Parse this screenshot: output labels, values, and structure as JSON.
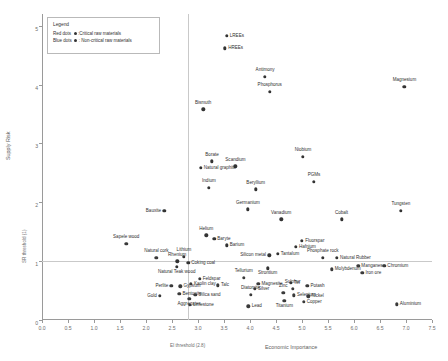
{
  "legend": {
    "title": "Legend",
    "entries": [
      {
        "prefix": "Red dots",
        "suffix": ":Critical raw materials",
        "color": "#333333"
      },
      {
        "prefix": "Blue dots",
        "suffix": ": Non-critical raw materials",
        "color": "#3a3a3a"
      }
    ]
  },
  "chart_data": {
    "type": "scatter",
    "title": "",
    "xlabel": "Economic Importance",
    "ylabel": "Supply Risk",
    "xlim": [
      0.0,
      7.5
    ],
    "ylim": [
      0,
      5.2
    ],
    "xticks": [
      "0.0",
      "0.5",
      "1.0",
      "1.5",
      "2.0",
      "2.5",
      "3.0",
      "3.5",
      "4.0",
      "4.5",
      "5.0",
      "5.5",
      "6.0",
      "6.5",
      "7.0",
      "7.5"
    ],
    "yticks": [
      "0",
      "1",
      "2",
      "3",
      "4",
      "5"
    ],
    "grid": false,
    "legend_position": "top-left",
    "annotations": [
      {
        "name": "ei-threshold",
        "label": "EI threshold (2.8)",
        "axis": "x",
        "value": 2.8
      },
      {
        "name": "sr-threshold",
        "label": "SR threshold (1)",
        "axis": "y",
        "value": 1.0
      }
    ],
    "series": [
      {
        "name": "Critical raw materials",
        "color": "#333333",
        "points": [
          {
            "label": "LREEs",
            "x": 3.55,
            "y": 4.83,
            "pos": "right"
          },
          {
            "label": "HREEs",
            "x": 3.52,
            "y": 4.62,
            "pos": "right"
          },
          {
            "label": "Antimony",
            "x": 4.29,
            "y": 4.13,
            "pos": "above"
          },
          {
            "label": "Phosphorus",
            "x": 4.38,
            "y": 3.88,
            "pos": "above"
          },
          {
            "label": "Bismuth",
            "x": 3.1,
            "y": 3.58,
            "pos": "above"
          },
          {
            "label": "Magnesium",
            "x": 6.97,
            "y": 3.96,
            "pos": "above"
          },
          {
            "label": "Niobium",
            "x": 5.02,
            "y": 2.77,
            "pos": "above"
          },
          {
            "label": "Borate",
            "x": 3.27,
            "y": 2.7,
            "pos": "above"
          },
          {
            "label": "Scandium",
            "x": 3.72,
            "y": 2.61,
            "pos": "above"
          },
          {
            "label": "Natural graphite",
            "x": 3.05,
            "y": 2.59,
            "pos": "right"
          },
          {
            "label": "PGMs",
            "x": 5.23,
            "y": 2.35,
            "pos": "above"
          },
          {
            "label": "Indium",
            "x": 3.21,
            "y": 2.25,
            "pos": "above"
          },
          {
            "label": "Beryllium",
            "x": 4.11,
            "y": 2.22,
            "pos": "above"
          },
          {
            "label": "Germanium",
            "x": 3.96,
            "y": 1.88,
            "pos": "above"
          },
          {
            "label": "Vanadium",
            "x": 4.6,
            "y": 1.71,
            "pos": "above"
          },
          {
            "label": "Tungsten",
            "x": 6.9,
            "y": 1.86,
            "pos": "above"
          },
          {
            "label": "Cobalt",
            "x": 5.76,
            "y": 1.71,
            "pos": "above"
          },
          {
            "label": "Helium",
            "x": 3.16,
            "y": 1.44,
            "pos": "above"
          },
          {
            "label": "Baryte",
            "x": 3.31,
            "y": 1.38,
            "pos": "right"
          },
          {
            "label": "Barium",
            "x": 3.55,
            "y": 1.27,
            "pos": "right"
          },
          {
            "label": "Fluorspar",
            "x": 5.0,
            "y": 1.35,
            "pos": "right"
          },
          {
            "label": "Hafnium",
            "x": 4.88,
            "y": 1.24,
            "pos": "right"
          },
          {
            "label": "Tantalum",
            "x": 4.53,
            "y": 1.13,
            "pos": "right"
          },
          {
            "label": "Silicon metal",
            "x": 4.37,
            "y": 1.1,
            "pos": "left"
          },
          {
            "label": "Phosphate rock",
            "x": 5.4,
            "y": 1.06,
            "pos": "above"
          },
          {
            "label": "Natural Rubber",
            "x": 5.67,
            "y": 1.06,
            "pos": "right"
          },
          {
            "label": "Lithium",
            "x": 2.73,
            "y": 1.07,
            "pos": "above"
          },
          {
            "label": "Coking coal",
            "x": 2.81,
            "y": 0.97,
            "pos": "right"
          },
          {
            "label": "Rhenium",
            "x": 2.6,
            "y": 1.0,
            "pos": "above"
          },
          {
            "label": "Natural Teak wood",
            "x": 2.59,
            "y": 0.9,
            "pos": "below"
          },
          {
            "label": "Strontium",
            "x": 4.34,
            "y": 0.88,
            "pos": "below"
          },
          {
            "label": "Bauxite",
            "x": 2.35,
            "y": 1.86,
            "pos": "left"
          }
        ]
      },
      {
        "name": "Non-critical raw materials",
        "color": "#3a3a3a",
        "points": [
          {
            "label": "Sapele wood",
            "x": 1.62,
            "y": 1.29,
            "pos": "above"
          },
          {
            "label": "Natural cork",
            "x": 2.2,
            "y": 1.06,
            "pos": "above"
          },
          {
            "label": "Manganese",
            "x": 6.08,
            "y": 0.92,
            "pos": "right"
          },
          {
            "label": "Chromium",
            "x": 6.58,
            "y": 0.92,
            "pos": "right"
          },
          {
            "label": "Molybdenum",
            "x": 5.57,
            "y": 0.86,
            "pos": "right"
          },
          {
            "label": "Iron ore",
            "x": 6.16,
            "y": 0.8,
            "pos": "right"
          },
          {
            "label": "Tellurium",
            "x": 3.88,
            "y": 0.72,
            "pos": "above"
          },
          {
            "label": "Feldspar",
            "x": 3.03,
            "y": 0.7,
            "pos": "right"
          },
          {
            "label": "Magnesite",
            "x": 4.16,
            "y": 0.62,
            "pos": "right"
          },
          {
            "label": "Tin",
            "x": 4.78,
            "y": 0.63,
            "pos": "right"
          },
          {
            "label": "Potash",
            "x": 5.1,
            "y": 0.58,
            "pos": "right"
          },
          {
            "label": "Sulphur",
            "x": 4.82,
            "y": 0.53,
            "pos": "above"
          },
          {
            "label": "Silver",
            "x": 4.09,
            "y": 0.53,
            "pos": "right"
          },
          {
            "label": "Perlite",
            "x": 2.49,
            "y": 0.58,
            "pos": "left"
          },
          {
            "label": "Gypsum",
            "x": 2.66,
            "y": 0.57,
            "pos": "right"
          },
          {
            "label": "Kaolin clay",
            "x": 2.86,
            "y": 0.61,
            "pos": "right"
          },
          {
            "label": "Talc",
            "x": 3.38,
            "y": 0.59,
            "pos": "right"
          },
          {
            "label": "Diatomite",
            "x": 4.01,
            "y": 0.43,
            "pos": "above"
          },
          {
            "label": "Zinc",
            "x": 4.64,
            "y": 0.46,
            "pos": "above"
          },
          {
            "label": "Selenium",
            "x": 4.84,
            "y": 0.42,
            "pos": "right"
          },
          {
            "label": "Nickel",
            "x": 5.12,
            "y": 0.4,
            "pos": "right"
          },
          {
            "label": "Gold",
            "x": 2.27,
            "y": 0.41,
            "pos": "left"
          },
          {
            "label": "Bentonite",
            "x": 2.64,
            "y": 0.44,
            "pos": "right"
          },
          {
            "label": "Silica sand",
            "x": 2.95,
            "y": 0.43,
            "pos": "right"
          },
          {
            "label": "Aggregates",
            "x": 2.83,
            "y": 0.36,
            "pos": "below"
          },
          {
            "label": "Titanium",
            "x": 4.66,
            "y": 0.33,
            "pos": "below"
          },
          {
            "label": "Copper",
            "x": 5.03,
            "y": 0.31,
            "pos": "right"
          },
          {
            "label": "Limestone",
            "x": 2.84,
            "y": 0.26,
            "pos": "right"
          },
          {
            "label": "Lead",
            "x": 3.97,
            "y": 0.23,
            "pos": "right"
          },
          {
            "label": "Aluminium",
            "x": 6.82,
            "y": 0.27,
            "pos": "right"
          }
        ]
      }
    ]
  }
}
